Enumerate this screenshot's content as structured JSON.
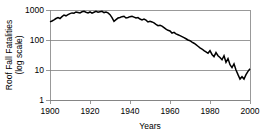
{
  "chart_data": {
    "type": "line",
    "title": "",
    "xlabel": "Years",
    "ylabel": "Roof Fall Fatalities\n(log scale)",
    "ylabel_line1": "Roof Fall Fatalities",
    "ylabel_line2": "(log scale)",
    "yscale": "log",
    "ylim": [
      1,
      1000
    ],
    "xlim": [
      1900,
      2000
    ],
    "xticks": [
      1900,
      1920,
      1940,
      1960,
      1980,
      2000
    ],
    "xtick_labels": [
      "1900",
      "1920",
      "1940",
      "1960",
      "1980",
      "2000"
    ],
    "yticks": [
      1,
      10,
      100,
      1000
    ],
    "ytick_labels": [
      "1",
      "10",
      "100",
      "1000"
    ],
    "grid": "horizontal",
    "legend": "none",
    "series_color": "#000000",
    "grid_color": "#808080",
    "background_color": "#ffffff",
    "series": [
      {
        "name": "Roof Fall Fatalities",
        "x": [
          1900,
          1901,
          1902,
          1903,
          1904,
          1905,
          1906,
          1907,
          1908,
          1909,
          1910,
          1911,
          1912,
          1913,
          1914,
          1915,
          1916,
          1917,
          1918,
          1919,
          1920,
          1921,
          1922,
          1923,
          1924,
          1925,
          1926,
          1927,
          1928,
          1929,
          1930,
          1931,
          1932,
          1933,
          1934,
          1935,
          1936,
          1937,
          1938,
          1939,
          1940,
          1941,
          1942,
          1943,
          1944,
          1945,
          1946,
          1947,
          1948,
          1949,
          1950,
          1951,
          1952,
          1953,
          1954,
          1955,
          1956,
          1957,
          1958,
          1959,
          1960,
          1961,
          1962,
          1963,
          1964,
          1965,
          1966,
          1967,
          1968,
          1969,
          1970,
          1971,
          1972,
          1973,
          1974,
          1975,
          1976,
          1977,
          1978,
          1979,
          1980,
          1981,
          1982,
          1983,
          1984,
          1985,
          1986,
          1987,
          1988,
          1989,
          1990,
          1991,
          1992,
          1993,
          1994,
          1995,
          1996,
          1997,
          1998,
          1999,
          2000
        ],
        "values": [
          400,
          430,
          470,
          520,
          560,
          520,
          600,
          680,
          640,
          700,
          760,
          800,
          780,
          860,
          830,
          800,
          870,
          900,
          840,
          800,
          860,
          780,
          840,
          900,
          850,
          880,
          900,
          820,
          860,
          800,
          700,
          560,
          420,
          480,
          540,
          560,
          600,
          620,
          540,
          560,
          600,
          620,
          580,
          540,
          560,
          500,
          470,
          500,
          460,
          400,
          420,
          400,
          370,
          330,
          300,
          310,
          290,
          260,
          230,
          210,
          200,
          170,
          180,
          160,
          150,
          140,
          130,
          120,
          110,
          100,
          95,
          85,
          78,
          70,
          62,
          55,
          50,
          44,
          40,
          36,
          44,
          33,
          28,
          38,
          30,
          26,
          22,
          30,
          18,
          24,
          15,
          12,
          16,
          10,
          7,
          5,
          6,
          5,
          7,
          9,
          11
        ]
      }
    ]
  },
  "axes": {
    "x_axis_name": "years-axis",
    "y_axis_name": "fatalities-axis"
  }
}
